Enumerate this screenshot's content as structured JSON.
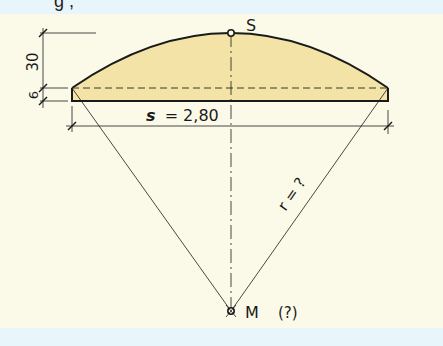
{
  "header": {
    "partial_text": "g ,"
  },
  "diagram": {
    "top_point_label": "S",
    "center_point_label": "M",
    "center_note": "(?)",
    "rise_dimension": "30",
    "band_thickness_dimension": "6",
    "chord_label_var": "s",
    "chord_label_value": "= 2,80",
    "radius_label": "r = ?",
    "colors": {
      "fill": "#f3e3a6",
      "stroke": "#1a1a1a",
      "background": "#fbfae9",
      "band": "#e8f6fb"
    }
  }
}
